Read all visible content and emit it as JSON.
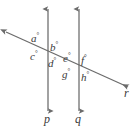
{
  "figure": {
    "type": "geometry-diagram",
    "background_color": "#ffffff",
    "stroke_color": "#6b6b6b",
    "text_color": "#3a3a3a",
    "degree_symbol": "°"
  },
  "lines": [
    {
      "id": "p",
      "label": "p",
      "orientation": "vertical",
      "x": 48,
      "y_top": 8,
      "y_bottom": 112,
      "arrow_top": true,
      "arrow_bottom": true,
      "label_x": 44,
      "label_y": 115
    },
    {
      "id": "q",
      "label": "q",
      "orientation": "vertical",
      "x": 79,
      "y_top": 8,
      "y_bottom": 112,
      "arrow_top": true,
      "arrow_bottom": true,
      "label_x": 75,
      "label_y": 115
    },
    {
      "id": "r",
      "label": "r",
      "orientation": "transversal",
      "x_start": 4,
      "y_start": 31,
      "x_end": 130,
      "y_end": 88,
      "arrow_start": true,
      "arrow_end": true,
      "label_x": 123,
      "label_y": 89
    }
  ],
  "intersections": [
    {
      "id": "P1",
      "lines": [
        "p",
        "r"
      ],
      "x": 48,
      "y": 51
    },
    {
      "id": "P2",
      "lines": [
        "q",
        "r"
      ],
      "x": 79,
      "y": 65
    }
  ],
  "angle_labels": [
    {
      "id": "a",
      "text": "a",
      "degree": "°",
      "at_intersection": "P1",
      "position": "upper-left",
      "x": 31,
      "y": 33
    },
    {
      "id": "b",
      "text": "b",
      "degree": "°",
      "at_intersection": "P1",
      "position": "upper-right",
      "x": 50,
      "y": 42
    },
    {
      "id": "c",
      "text": "c",
      "degree": "°",
      "at_intersection": "P1",
      "position": "lower-left",
      "x": 30,
      "y": 51
    },
    {
      "id": "d",
      "text": "d",
      "degree": "°",
      "at_intersection": "P1",
      "position": "lower-right",
      "x": 48,
      "y": 57
    },
    {
      "id": "e",
      "text": "e",
      "degree": "°",
      "at_intersection": "P2",
      "position": "upper-left",
      "x": 63,
      "y": 52
    },
    {
      "id": "f",
      "text": "f",
      "degree": "°",
      "at_intersection": "P2",
      "position": "upper-right",
      "x": 81,
      "y": 55
    },
    {
      "id": "g",
      "text": "g",
      "degree": "°",
      "at_intersection": "P2",
      "position": "lower-left",
      "x": 62,
      "y": 68
    },
    {
      "id": "h",
      "text": "h",
      "degree": "°",
      "at_intersection": "P2",
      "position": "lower-right",
      "x": 81,
      "y": 71
    }
  ]
}
